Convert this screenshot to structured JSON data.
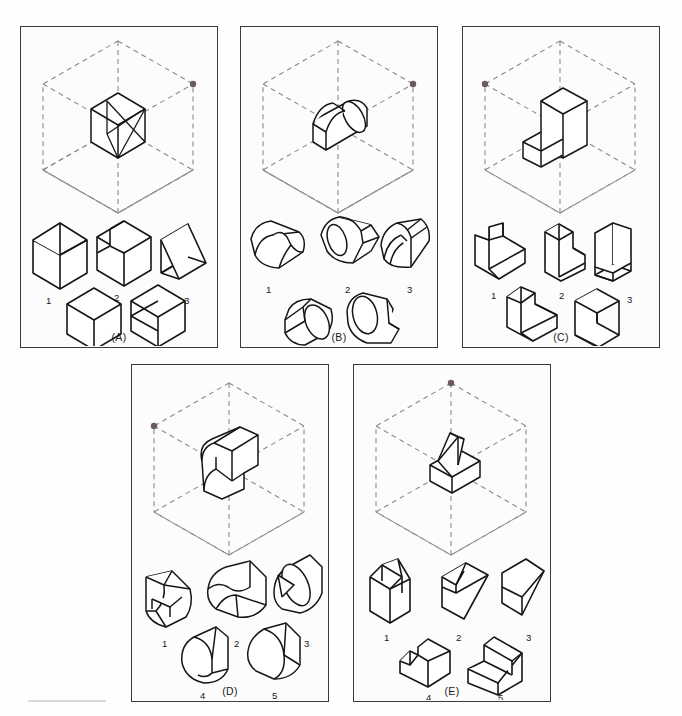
{
  "page": {
    "kind": "spatial-visualization-test-figure",
    "background_color": "#fefefe",
    "panel_border_color": "#3a3a3a",
    "line_color": "#1a1a1a",
    "dash_color": "#8a8a8a",
    "marker_color": "#6b5b5b",
    "panel_count": 5,
    "choices_per_panel": 5
  },
  "panels": [
    {
      "id": "A",
      "label": "(A)",
      "x": 20,
      "y": 26,
      "w": 198,
      "h": 322,
      "marker_vertex": "right-upper",
      "object_description": "cube with diagonal prism cut",
      "choices": [
        {
          "num": "1",
          "shape": "open-corner-box-left"
        },
        {
          "num": "2",
          "shape": "corner-block"
        },
        {
          "num": "3",
          "shape": "cube-with-triangular-face"
        },
        {
          "num": "4",
          "shape": "plain-cube"
        },
        {
          "num": "5",
          "shape": "cube-with-diagonal-slot"
        }
      ]
    },
    {
      "id": "B",
      "label": "(B)",
      "x": 240,
      "y": 26,
      "w": 198,
      "h": 322,
      "marker_vertex": "right-upper",
      "object_description": "cylinder with rectangular notch",
      "choices": [
        {
          "num": "1",
          "shape": "cylinder-with-v-notch-top"
        },
        {
          "num": "2",
          "shape": "cylinder-with-step-tab"
        },
        {
          "num": "3",
          "shape": "cylinder-with-ribbed-slot"
        },
        {
          "num": "4",
          "shape": "cylinder-with-wedge-tab"
        },
        {
          "num": "5",
          "shape": "cylinder-with-flat-tail"
        }
      ]
    },
    {
      "id": "C",
      "label": "(C)",
      "x": 462,
      "y": 26,
      "w": 198,
      "h": 322,
      "marker_vertex": "left-upper",
      "object_description": "tall block with angled wedge base",
      "choices": [
        {
          "num": "1",
          "shape": "block-with-chamfer"
        },
        {
          "num": "2",
          "shape": "L-block-upright"
        },
        {
          "num": "3",
          "shape": "L-bracket-thin"
        },
        {
          "num": "4",
          "shape": "L-block-flat"
        },
        {
          "num": "5",
          "shape": "Z-block"
        }
      ]
    },
    {
      "id": "D",
      "label": "(D)",
      "x": 131,
      "y": 364,
      "w": 198,
      "h": 338,
      "marker_vertex": "left-upper",
      "object_description": "rounded slab with rectangular boss",
      "choices": [
        {
          "num": "1",
          "shape": "half-cylinder-with-pocket"
        },
        {
          "num": "2",
          "shape": "half-cylinder-scooped"
        },
        {
          "num": "3",
          "shape": "half-cylinder-with-v-cut"
        },
        {
          "num": "4",
          "shape": "half-cylinder-curl"
        },
        {
          "num": "5",
          "shape": "half-cylinder-plain"
        }
      ]
    },
    {
      "id": "E",
      "label": "(E)",
      "x": 353,
      "y": 364,
      "w": 198,
      "h": 338,
      "marker_vertex": "top",
      "object_description": "wedge on rectangular base",
      "choices": [
        {
          "num": "1",
          "shape": "tall-wedge-block"
        },
        {
          "num": "2",
          "shape": "rhombus-with-notch"
        },
        {
          "num": "3",
          "shape": "rhombus-divided"
        },
        {
          "num": "4",
          "shape": "notched-slab"
        },
        {
          "num": "5",
          "shape": "angled-L-solid"
        }
      ]
    }
  ]
}
